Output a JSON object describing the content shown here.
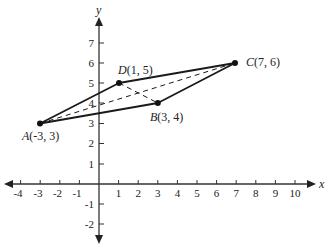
{
  "diagram": {
    "type": "coordinate-plane-quadrilateral",
    "axes": {
      "x_label": "x",
      "y_label": "y",
      "x_ticks": [
        "-4",
        "-3",
        "-2",
        "-1",
        "1",
        "2",
        "3",
        "4",
        "5",
        "6",
        "7",
        "8",
        "9",
        "10"
      ],
      "y_ticks": [
        "7",
        "6",
        "5",
        "4",
        "3",
        "2",
        "1",
        "-1",
        "-2"
      ]
    },
    "points": [
      {
        "name": "A",
        "coords": "(-3, 3)",
        "x": -3,
        "y": 3
      },
      {
        "name": "B",
        "coords": "(3, 4)",
        "x": 3,
        "y": 4
      },
      {
        "name": "C",
        "coords": "(7, 6)",
        "x": 7,
        "y": 6
      },
      {
        "name": "D",
        "coords": "(1, 5)",
        "x": 1,
        "y": 5
      }
    ],
    "solid_segments": [
      "AB",
      "BC",
      "CD",
      "DA"
    ],
    "dashed_segments": [
      "AC",
      "DB"
    ],
    "colors": {
      "line": "#1a1a1a",
      "background": "#ffffff"
    }
  }
}
